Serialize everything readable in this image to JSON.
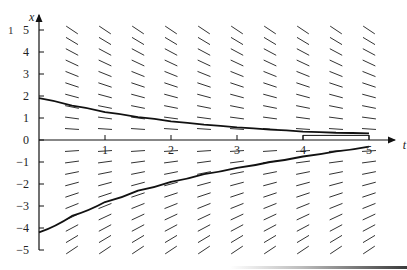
{
  "chart_data": {
    "type": "line",
    "subtype": "direction_field",
    "title": "",
    "xlabel": "t",
    "ylabel": "x",
    "xlim": [
      0,
      5.3
    ],
    "ylim": [
      -5,
      5.5
    ],
    "x_ticks": [
      1,
      2,
      3,
      4,
      5
    ],
    "x_tick_labels": [
      "1",
      "2",
      "3",
      "4",
      "5"
    ],
    "y_ticks": [
      -5,
      -4,
      -3,
      -2,
      -1,
      0,
      1,
      2,
      3,
      4,
      5
    ],
    "y_tick_labels": [
      "-5",
      "-4",
      "-3",
      "-2",
      "-1",
      "0",
      "1",
      "2",
      "3",
      "4",
      "5"
    ],
    "grid": false,
    "legend": null,
    "direction_field": {
      "equation": "dx/dt = -0.4 x",
      "rate": -0.4,
      "t_samples": [
        0.5,
        1.0,
        1.5,
        2.0,
        2.5,
        3.0,
        3.5,
        4.0,
        4.5,
        5.0
      ],
      "x_samples": [
        -5.0,
        -4.5,
        -4.0,
        -3.5,
        -3.0,
        -2.5,
        -2.0,
        -1.5,
        -1.0,
        -0.5,
        0.5,
        1.0,
        1.5,
        2.0,
        2.5,
        3.0,
        3.5,
        4.0,
        4.5,
        5.0
      ],
      "segment_length_px": 14
    },
    "series": [
      {
        "name": "solution-upper",
        "t": [
          0,
          0.5,
          1,
          1.5,
          2,
          2.5,
          3,
          3.5,
          4,
          4.5,
          5
        ],
        "x": [
          1.9,
          1.56,
          1.27,
          1.04,
          0.85,
          0.7,
          0.57,
          0.47,
          0.38,
          0.33,
          0.3
        ]
      },
      {
        "name": "solution-lower",
        "t": [
          0,
          0.5,
          1,
          1.5,
          2,
          2.5,
          3,
          3.5,
          4,
          4.5,
          5
        ],
        "x": [
          -4.2,
          -3.45,
          -2.82,
          -2.3,
          -1.9,
          -1.55,
          -1.27,
          -1.0,
          -0.75,
          -0.52,
          -0.3
        ]
      }
    ],
    "annotations": [
      {
        "type": "bracket",
        "t_from": 4,
        "t_to": 5,
        "x": 0.3,
        "label": ""
      }
    ]
  },
  "page": {
    "corner_mark": "1"
  }
}
